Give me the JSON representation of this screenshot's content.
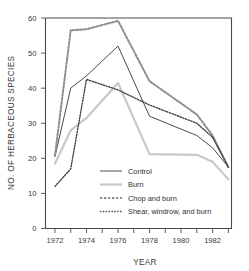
{
  "chart_data": {
    "type": "line",
    "title": "",
    "xlabel": "YEAR",
    "ylabel": "NO. OF HERBACEOUS SPECIES",
    "xlim": [
      1971.4,
      1983.2
    ],
    "ylim": [
      0,
      60
    ],
    "yticks": [
      0,
      10,
      20,
      30,
      40,
      50,
      60
    ],
    "ytick_labels": [
      "0",
      "10",
      "20",
      "30",
      "40",
      "50",
      "60"
    ],
    "xticks": [
      1972,
      1973,
      1974,
      1975,
      1976,
      1977,
      1978,
      1979,
      1980,
      1981,
      1982,
      1983
    ],
    "xtick_labels_major": [
      "1972",
      "1974",
      "1976",
      "1978",
      "1980",
      "1982"
    ],
    "xticks_major": [
      1972,
      1974,
      1976,
      1978,
      1980,
      1982
    ],
    "grid": false,
    "legend_position": "center",
    "x": [
      1972,
      1973,
      1974,
      1976,
      1978,
      1981,
      1982,
      1983
    ],
    "series": [
      {
        "name": "Control",
        "style": "solid",
        "color": "#4a4a4a",
        "width": 1.0,
        "values": [
          20.5,
          40.0,
          43.5,
          52.0,
          32.0,
          26.5,
          23.0,
          17.5
        ]
      },
      {
        "name": "Burn",
        "style": "solid",
        "color": "#c8c8c8",
        "width": 2.2,
        "values": [
          18.5,
          28.0,
          31.5,
          41.5,
          21.2,
          21.0,
          19.0,
          14.0
        ]
      },
      {
        "name": "Chop and burn",
        "style": "dashed",
        "color": "#8f8f8f",
        "width": 2.0,
        "values": [
          20.8,
          56.5,
          56.8,
          59.2,
          42.0,
          32.5,
          26.5,
          17.5
        ]
      },
      {
        "name": "Shear, windrow, and burn",
        "style": "dotted",
        "color": "#454545",
        "width": 1.4,
        "values": [
          12.0,
          17.0,
          42.5,
          39.5,
          35.2,
          30.0,
          26.0,
          17.5
        ]
      }
    ]
  },
  "legend": {
    "items": [
      {
        "label": "Control"
      },
      {
        "label": "Burn"
      },
      {
        "label": "Chop and burn"
      },
      {
        "label": "Shear, windrow, and burn"
      }
    ]
  }
}
